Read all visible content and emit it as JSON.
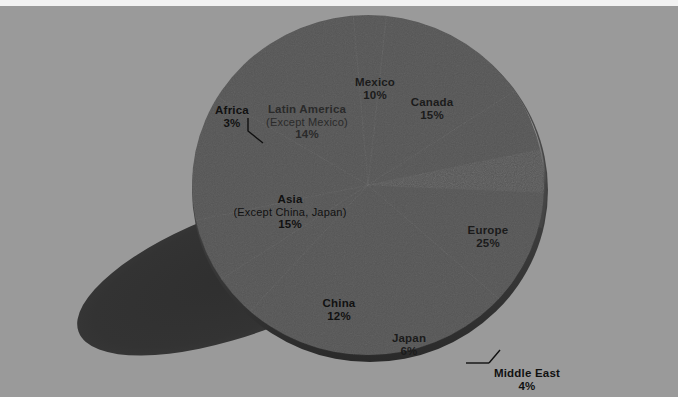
{
  "figure": {
    "width": 678,
    "height": 397,
    "background_color": "#9a9a9a",
    "top_strip_color": "#f2f2f2"
  },
  "chart_data": {
    "type": "pie",
    "title": "",
    "subtitle": "",
    "xlabel": "",
    "ylabel": "",
    "grid": false,
    "legend_position": "none",
    "style": "3d-exploded-pie-with-drop-shadow",
    "labels_inside_slices": true,
    "total_percent": 104,
    "categories": [
      "Canada",
      "Europe",
      "Middle East",
      "Japan",
      "China",
      "Asia (Except China, Japan)",
      "Africa",
      "Latin America (Except Mexico)",
      "Mexico"
    ],
    "values": [
      15,
      25,
      4,
      6,
      12,
      15,
      3,
      14,
      10
    ],
    "slices": [
      {
        "name": "Canada",
        "sub": "",
        "percent": 15,
        "percent_label": "15%",
        "color": "#4a4a4a",
        "label_color": "#141414",
        "start_deg": 348,
        "end_deg": 402,
        "label_x": 432,
        "label_y": 96,
        "has_leader": false,
        "text_tone": "dark"
      },
      {
        "name": "Europe",
        "sub": "",
        "percent": 25,
        "percent_label": "25%",
        "color": "#3a3a3a",
        "label_color": "#141414",
        "start_deg": 402,
        "end_deg": 492,
        "label_x": 488,
        "label_y": 224,
        "has_leader": false,
        "text_tone": "dark"
      },
      {
        "name": "Middle East",
        "sub": "",
        "percent": 4,
        "percent_label": "4%",
        "color": "#1a1a1a",
        "label_color": "#111111",
        "start_deg": 492,
        "end_deg": 506.4,
        "label_x": 527,
        "label_y": 367,
        "has_leader": true,
        "text_tone": "light"
      },
      {
        "name": "Japan",
        "sub": "",
        "percent": 6,
        "percent_label": "6%",
        "color": "#6f6f6f",
        "label_color": "#141414",
        "start_deg": 506.4,
        "end_deg": 528,
        "label_x": 409,
        "label_y": 332,
        "has_leader": false,
        "text_tone": "dark"
      },
      {
        "name": "China",
        "sub": "",
        "percent": 12,
        "percent_label": "12%",
        "color": "#9b9b9b",
        "label_color": "#141414",
        "start_deg": 528,
        "end_deg": 571.2,
        "label_x": 339,
        "label_y": 297,
        "has_leader": false,
        "text_tone": "light"
      },
      {
        "name": "Asia",
        "sub": "(Except China, Japan)",
        "percent": 15,
        "percent_label": "15%",
        "color": "#a6a6a6",
        "label_color": "#141414",
        "start_deg": 571.2,
        "end_deg": 625.2,
        "label_x": 290,
        "label_y": 193,
        "has_leader": false,
        "text_tone": "light"
      },
      {
        "name": "Africa",
        "sub": "",
        "percent": 3,
        "percent_label": "3%",
        "color": "#0e0e0e",
        "label_color": "#111111",
        "start_deg": 625.2,
        "end_deg": 636,
        "label_x": 232,
        "label_y": 104,
        "has_leader": true,
        "text_tone": "light"
      },
      {
        "name": "Latin America",
        "sub": "(Except Mexico)",
        "percent": 14,
        "percent_label": "14%",
        "color": "#262626",
        "label_color": "#3a3a3a",
        "start_deg": 636,
        "end_deg": 686.4,
        "label_x": 307,
        "label_y": 103,
        "has_leader": false,
        "text_tone": "onblack"
      },
      {
        "name": "Mexico",
        "sub": "",
        "percent": 10,
        "percent_label": "10%",
        "color": "#777777",
        "label_color": "#141414",
        "start_deg": 686.4,
        "end_deg": 722.4,
        "label_x": 375,
        "label_y": 76,
        "has_leader": false,
        "text_tone": "dark"
      }
    ],
    "annotations": [
      {
        "text": "Africa leader line",
        "from": [
          248,
          122
        ],
        "to": [
          262,
          140
        ]
      },
      {
        "text": "Middle East leader line",
        "from": [
          468,
          362
        ],
        "to": [
          490,
          352
        ]
      }
    ]
  }
}
